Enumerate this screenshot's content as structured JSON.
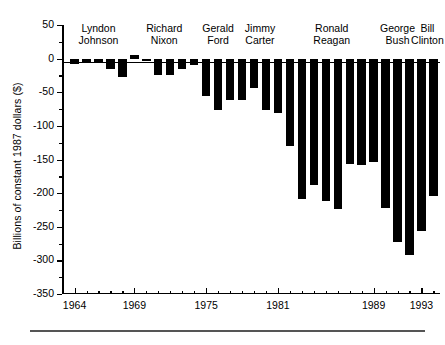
{
  "chart_data": {
    "type": "bar",
    "title": "",
    "subtitle": "",
    "xlabel": "",
    "ylabel": "Billions of constant 1987 dollars ($)",
    "ylim": [
      -350,
      50
    ],
    "ytick_values": [
      50,
      0,
      -50,
      -100,
      -150,
      -200,
      -250,
      -300,
      -350
    ],
    "ytick_labels": [
      "50",
      "0",
      "-50",
      "-100",
      "-150",
      "-200",
      "-250",
      "-300",
      "-350"
    ],
    "yminor_values": [
      25,
      -25,
      -75,
      -125,
      -175,
      -225,
      -275,
      -325
    ],
    "grid": false,
    "legend": false,
    "bar_color": "#000000",
    "xtick_labeled": [
      "1964",
      "1969",
      "1975",
      "1981",
      "1989",
      "1993"
    ],
    "categories": [
      "1964",
      "1965",
      "1966",
      "1967",
      "1968",
      "1969",
      "1970",
      "1971",
      "1972",
      "1973",
      "1974",
      "1975",
      "1976",
      "1977",
      "1978",
      "1979",
      "1980",
      "1981",
      "1982",
      "1983",
      "1984",
      "1985",
      "1986",
      "1987",
      "1988",
      "1989",
      "1990",
      "1991",
      "1992",
      "1993",
      "1994"
    ],
    "values": [
      -8,
      -5,
      -7,
      -16,
      -27,
      5,
      -4,
      -24,
      -25,
      -16,
      -9,
      -55,
      -76,
      -61,
      -62,
      -44,
      -76,
      -81,
      -130,
      -209,
      -188,
      -212,
      -223,
      -157,
      -158,
      -154,
      -222,
      -273,
      -292,
      -257,
      -205
    ],
    "series": [
      {
        "name": "Federal budget deficit",
        "values": [
          -8,
          -5,
          -7,
          -16,
          -27,
          5,
          -4,
          -24,
          -25,
          -16,
          -9,
          -55,
          -76,
          -61,
          -62,
          -44,
          -76,
          -81,
          -130,
          -209,
          -188,
          -212,
          -223,
          -157,
          -158,
          -154,
          -222,
          -273,
          -292,
          -257,
          -205
        ]
      }
    ],
    "groups": [
      {
        "name": "Lyndon Johnson",
        "line1": "Lyndon",
        "line2": "Johnson",
        "start_year": 1964,
        "end_year": 1968
      },
      {
        "name": "Richard Nixon",
        "line1": "Richard",
        "line2": "Nixon",
        "start_year": 1969,
        "end_year": 1974
      },
      {
        "name": "Gerald Ford",
        "line1": "Gerald",
        "line2": "Ford",
        "start_year": 1975,
        "end_year": 1977
      },
      {
        "name": "Jimmy Carter",
        "line1": "Jimmy",
        "line2": "Carter",
        "start_year": 1978,
        "end_year": 1981
      },
      {
        "name": "Ronald Reagan",
        "line1": "Ronald",
        "line2": "Reagan",
        "start_year": 1982,
        "end_year": 1989
      },
      {
        "name": "George Bush",
        "line1": "George",
        "line2": "Bush",
        "start_year": 1990,
        "end_year": 1992
      },
      {
        "name": "Bill Clinton",
        "line1": "Bill",
        "line2": "Clinton",
        "start_year": 1993,
        "end_year": 1994
      }
    ]
  }
}
